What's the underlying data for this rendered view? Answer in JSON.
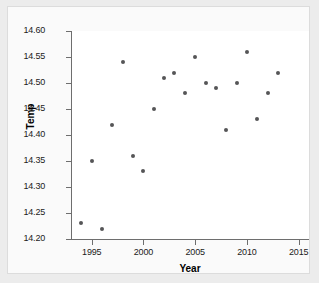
{
  "chart_data": {
    "type": "scatter",
    "title": "",
    "xlabel": "Year",
    "ylabel": "Temp",
    "xlim": [
      1993,
      2016
    ],
    "ylim": [
      14.2,
      14.6
    ],
    "xticks": [
      1995,
      2000,
      2005,
      2010,
      2015
    ],
    "yticks": [
      "14.20",
      "14.25",
      "14.30",
      "14.35",
      "14.40",
      "14.45",
      "14.50",
      "14.55",
      "14.60"
    ],
    "grid": false,
    "legend": null,
    "point_color": "#555557",
    "x": [
      1994,
      1995,
      1996,
      1997,
      1998,
      1999,
      2000,
      2001,
      2002,
      2003,
      2004,
      2005,
      2006,
      2007,
      2008,
      2009,
      2010,
      2011,
      2012,
      2013
    ],
    "y": [
      14.23,
      14.35,
      14.22,
      14.42,
      14.54,
      14.36,
      14.33,
      14.45,
      14.51,
      14.52,
      14.48,
      14.55,
      14.5,
      14.49,
      14.41,
      14.5,
      14.56,
      14.43,
      14.48,
      14.52
    ],
    "points": [
      {
        "year": 1994,
        "temp": 14.23
      },
      {
        "year": 1995,
        "temp": 14.35
      },
      {
        "year": 1996,
        "temp": 14.22
      },
      {
        "year": 1997,
        "temp": 14.42
      },
      {
        "year": 1998,
        "temp": 14.54
      },
      {
        "year": 1999,
        "temp": 14.36
      },
      {
        "year": 2000,
        "temp": 14.33
      },
      {
        "year": 2001,
        "temp": 14.45
      },
      {
        "year": 2002,
        "temp": 14.51
      },
      {
        "year": 2003,
        "temp": 14.52
      },
      {
        "year": 2004,
        "temp": 14.48
      },
      {
        "year": 2005,
        "temp": 14.55
      },
      {
        "year": 2006,
        "temp": 14.5
      },
      {
        "year": 2007,
        "temp": 14.49
      },
      {
        "year": 2008,
        "temp": 14.41
      },
      {
        "year": 2009,
        "temp": 14.5
      },
      {
        "year": 2010,
        "temp": 14.56
      },
      {
        "year": 2011,
        "temp": 14.43
      },
      {
        "year": 2012,
        "temp": 14.48
      },
      {
        "year": 2013,
        "temp": 14.52
      }
    ]
  }
}
